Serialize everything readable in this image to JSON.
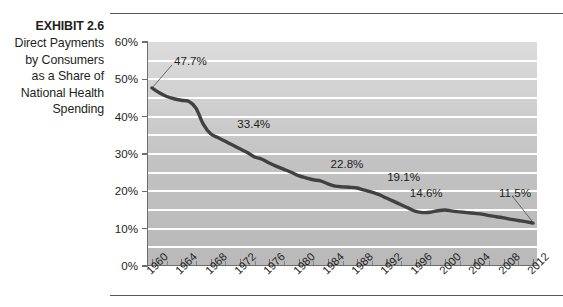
{
  "exhibit": {
    "number": "EXHIBIT 2.6",
    "caption_lines": [
      "Direct Payments",
      "by Consumers",
      "as a Share of",
      "National Health",
      "Spending"
    ]
  },
  "colors": {
    "line": "#414042",
    "plot_background_top": "#dcdcdc",
    "plot_background_bottom": "#b9b9b9",
    "gridline": "#ffffff",
    "axis": "#6d6e71",
    "text": "#231f20",
    "rule": "#58595b"
  },
  "chart_data": {
    "type": "line",
    "title": "Direct Payments by Consumers as a Share of National Health Spending",
    "xlabel": "",
    "ylabel": "",
    "xlim": [
      1960,
      2012
    ],
    "ylim": [
      0,
      60
    ],
    "ytick_labels": [
      "0%",
      "10%",
      "20%",
      "30%",
      "40%",
      "50%",
      "60%"
    ],
    "ytick_values": [
      0,
      10,
      20,
      30,
      40,
      50,
      60
    ],
    "gridline_values": [
      5,
      10,
      15,
      20,
      25,
      30,
      35,
      40,
      45,
      50,
      55
    ],
    "grid": true,
    "legend": "none",
    "xtick_labels": [
      "1960",
      "1964",
      "1968",
      "1972",
      "1976",
      "1980",
      "1984",
      "1988",
      "1992",
      "1996",
      "2000",
      "2004",
      "2008",
      "2012"
    ],
    "xtick_values": [
      1960,
      1964,
      1968,
      1972,
      1976,
      1980,
      1984,
      1988,
      1992,
      1996,
      2000,
      2004,
      2008,
      2012
    ],
    "x": [
      1960,
      1961,
      1962,
      1963,
      1964,
      1965,
      1966,
      1967,
      1968,
      1969,
      1970,
      1971,
      1972,
      1973,
      1974,
      1975,
      1976,
      1977,
      1978,
      1979,
      1980,
      1981,
      1982,
      1983,
      1984,
      1985,
      1986,
      1987,
      1988,
      1989,
      1990,
      1991,
      1992,
      1993,
      1994,
      1995,
      1996,
      1997,
      1998,
      1999,
      2000,
      2001,
      2002,
      2003,
      2004,
      2005,
      2006,
      2007,
      2008,
      2009,
      2010,
      2011,
      2012
    ],
    "values": [
      47.7,
      46.4,
      45.4,
      44.8,
      44.4,
      44.1,
      42.3,
      38.0,
      35.4,
      34.4,
      33.4,
      32.4,
      31.4,
      30.4,
      29.2,
      28.6,
      27.6,
      26.7,
      25.9,
      25.1,
      24.2,
      23.6,
      23.1,
      22.8,
      22.0,
      21.4,
      21.2,
      21.1,
      20.9,
      20.3,
      19.8,
      19.1,
      18.2,
      17.3,
      16.4,
      15.5,
      14.6,
      14.3,
      14.4,
      14.8,
      15.0,
      14.7,
      14.5,
      14.3,
      14.1,
      13.9,
      13.5,
      13.2,
      12.9,
      12.5,
      12.2,
      11.9,
      11.5
    ],
    "annotations": [
      {
        "label": "47.7%",
        "year": 1960,
        "value": 47.7,
        "has_leader_line": true
      },
      {
        "label": "33.4%",
        "year": 1970,
        "value": 33.4,
        "has_leader_line": false
      },
      {
        "label": "22.8%",
        "year": 1983,
        "value": 22.8,
        "has_leader_line": false
      },
      {
        "label": "19.1%",
        "year": 1991,
        "value": 19.1,
        "has_leader_line": false
      },
      {
        "label": "14.6%",
        "year": 1996,
        "value": 14.6,
        "has_leader_line": false
      },
      {
        "label": "11.5%",
        "year": 2012,
        "value": 11.5,
        "has_leader_line": true
      }
    ]
  }
}
